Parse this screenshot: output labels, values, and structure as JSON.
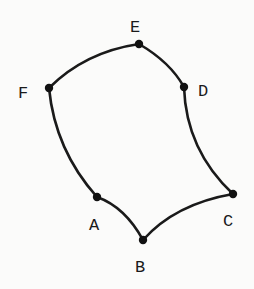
{
  "diagram": {
    "type": "curved-hexagon",
    "vertices": [
      {
        "id": "A",
        "label": "A",
        "x": 97,
        "y": 197,
        "label_x": 89,
        "label_y": 230
      },
      {
        "id": "B",
        "label": "B",
        "x": 143,
        "y": 240,
        "label_x": 135,
        "label_y": 272
      },
      {
        "id": "C",
        "label": "C",
        "x": 233,
        "y": 194,
        "label_x": 223,
        "label_y": 226
      },
      {
        "id": "D",
        "label": "D",
        "x": 184,
        "y": 87,
        "label_x": 198,
        "label_y": 96
      },
      {
        "id": "E",
        "label": "E",
        "x": 139,
        "y": 44,
        "label_x": 130,
        "label_y": 32
      },
      {
        "id": "F",
        "label": "F",
        "x": 49,
        "y": 88,
        "label_x": 18,
        "label_y": 98
      }
    ],
    "edges": [
      {
        "from": "F",
        "to": "E"
      },
      {
        "from": "E",
        "to": "D"
      },
      {
        "from": "D",
        "to": "C"
      },
      {
        "from": "C",
        "to": "B"
      },
      {
        "from": "B",
        "to": "A"
      },
      {
        "from": "A",
        "to": "F"
      }
    ],
    "colors": {
      "stroke": "#1a1a1a",
      "point": "#111111",
      "background": "#fbfbfa"
    }
  }
}
